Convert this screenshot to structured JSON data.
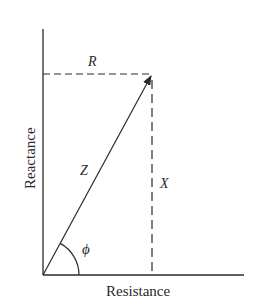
{
  "diagram": {
    "type": "impedance-triangle",
    "axes": {
      "x_label": "Resistance",
      "y_label": "Reactance"
    },
    "labels": {
      "resistance": "R",
      "reactance": "X",
      "impedance": "Z",
      "phase_angle": "ϕ"
    },
    "colors": {
      "line": "#2a2a2a",
      "background": "#ffffff"
    }
  }
}
